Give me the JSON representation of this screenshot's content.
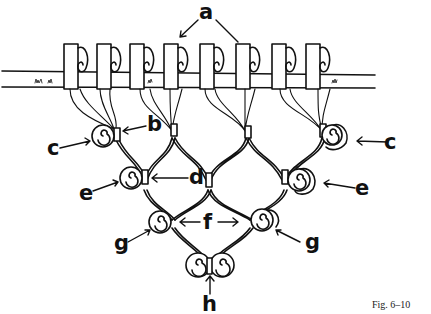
{
  "figure": {
    "caption": "Fig. 6–10",
    "labels": {
      "a": "a",
      "b": "b",
      "c_left": "c",
      "c_right": "c",
      "d": "d",
      "e_left": "e",
      "e_right": "e",
      "f": "f",
      "g_left": "g",
      "g_right": "g",
      "h": "h"
    }
  },
  "colors": {
    "ink": "#111111",
    "background": "#ffffff"
  }
}
